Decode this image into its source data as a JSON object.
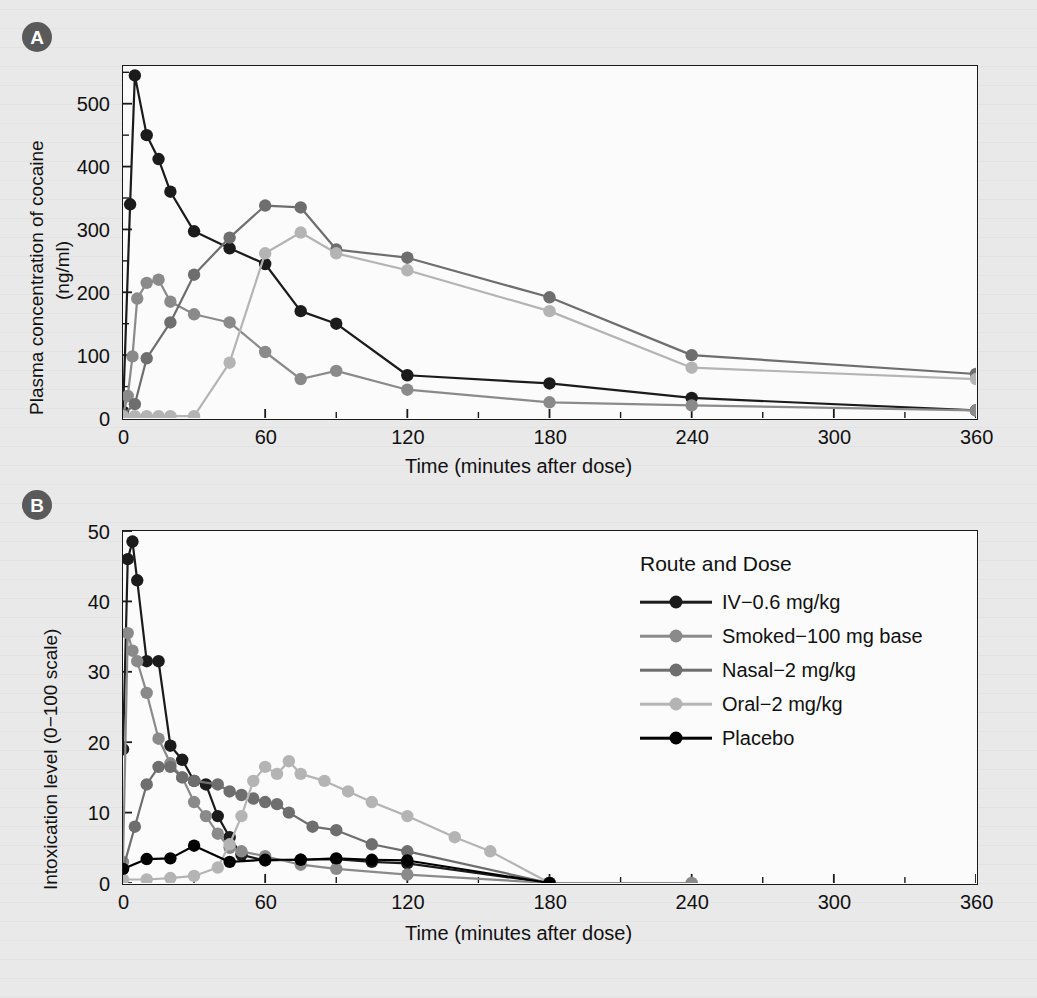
{
  "figure": {
    "panel_a_label": "A",
    "panel_b_label": "B"
  },
  "legend": {
    "title": "Route and Dose",
    "entries": [
      {
        "label": "IV−0.6 mg/kg",
        "color": "#1b1b1b",
        "key": "iv"
      },
      {
        "label": "Smoked−100 mg base",
        "color": "#8a8a8a",
        "key": "smoked"
      },
      {
        "label": "Nasal−2 mg/kg",
        "color": "#6e6e6e",
        "key": "nasal"
      },
      {
        "label": "Oral−2 mg/kg",
        "color": "#b4b4b4",
        "key": "oral"
      },
      {
        "label": "Placebo",
        "color": "#000000",
        "key": "placebo"
      }
    ]
  },
  "chart_data": [
    {
      "id": "panel-a",
      "type": "line",
      "title": "",
      "xlabel": "Time (minutes after dose)",
      "ylabel": "Plasma concentration of cocaine (ng/ml)",
      "ylabel_line1": "Plasma concentration of cocaine",
      "ylabel_line2": "(ng/ml)",
      "xlim": [
        0,
        360
      ],
      "ylim": [
        0,
        560
      ],
      "xticks": [
        0,
        60,
        120,
        180,
        240,
        300,
        360
      ],
      "xtick_labels": [
        "0",
        "60",
        "120",
        "180",
        "240",
        "300",
        "360"
      ],
      "xminor_step": 30,
      "yticks": [
        0,
        100,
        200,
        300,
        400,
        500
      ],
      "ytick_labels": [
        "0",
        "100",
        "200",
        "300",
        "400",
        "500"
      ],
      "yminor_step": 50,
      "grid": false,
      "legend_position": "none",
      "series": [
        {
          "name": "IV−0.6 mg/kg",
          "color": "#1b1b1b",
          "x": [
            0,
            3,
            5,
            10,
            15,
            20,
            30,
            45,
            60,
            75,
            90,
            120,
            180,
            240,
            360
          ],
          "y": [
            10,
            340,
            545,
            450,
            412,
            360,
            297,
            270,
            245,
            170,
            150,
            68,
            55,
            32,
            12
          ]
        },
        {
          "name": "Smoked−100 mg base",
          "color": "#8a8a8a",
          "x": [
            0,
            2,
            4,
            6,
            10,
            15,
            20,
            30,
            45,
            60,
            75,
            90,
            120,
            180,
            240,
            360
          ],
          "y": [
            5,
            35,
            98,
            190,
            215,
            220,
            185,
            165,
            152,
            105,
            62,
            75,
            45,
            25,
            20,
            12
          ]
        },
        {
          "name": "Nasal−2 mg/kg",
          "color": "#6e6e6e",
          "x": [
            0,
            5,
            10,
            20,
            30,
            45,
            60,
            75,
            90,
            120,
            180,
            240,
            360
          ],
          "y": [
            5,
            22,
            95,
            152,
            228,
            287,
            338,
            335,
            268,
            255,
            192,
            100,
            70,
            30
          ]
        },
        {
          "name": "Oral−2 mg/kg",
          "color": "#b4b4b4",
          "x": [
            0,
            5,
            10,
            15,
            20,
            30,
            45,
            60,
            75,
            90,
            120,
            180,
            240,
            360
          ],
          "y": [
            3,
            3,
            3,
            3,
            3,
            3,
            88,
            262,
            295,
            262,
            235,
            170,
            80,
            62,
            28
          ]
        }
      ],
      "series_notes": "Panel A shows plasma cocaine concentration vs time for four routes of administration."
    },
    {
      "id": "panel-b",
      "type": "line",
      "title": "",
      "xlabel": "Time (minutes after dose)",
      "ylabel": "Intoxication level (0−100 scale)",
      "xlim": [
        0,
        360
      ],
      "ylim": [
        0,
        50
      ],
      "xticks": [
        0,
        60,
        120,
        180,
        240,
        300,
        360
      ],
      "xtick_labels": [
        "0",
        "60",
        "120",
        "180",
        "240",
        "300",
        "360"
      ],
      "xminor_step": 30,
      "yticks": [
        0,
        10,
        20,
        30,
        40,
        50
      ],
      "ytick_labels": [
        "0",
        "10",
        "20",
        "30",
        "40",
        "50"
      ],
      "yminor_step": 10,
      "grid": false,
      "legend_position": "upper right",
      "series": [
        {
          "name": "IV−0.6 mg/kg",
          "color": "#1b1b1b",
          "x": [
            0,
            2,
            4,
            6,
            10,
            15,
            20,
            25,
            30,
            35,
            40,
            45,
            50,
            60,
            75,
            90,
            105,
            120,
            180
          ],
          "y": [
            19,
            46,
            48.5,
            43,
            31.5,
            31.5,
            19.5,
            17.5,
            14.5,
            14,
            9.5,
            6.5,
            4.0,
            3.2,
            3.3,
            3.4,
            3.0,
            2.8,
            0
          ]
        },
        {
          "name": "Smoked−100 mg base",
          "color": "#8a8a8a",
          "x": [
            0,
            2,
            4,
            6,
            10,
            15,
            20,
            25,
            30,
            35,
            40,
            45,
            50,
            60,
            75,
            90,
            120,
            180,
            240
          ],
          "y": [
            3,
            35.5,
            33,
            31.5,
            27,
            20.5,
            17,
            15,
            11.5,
            9.5,
            7,
            5,
            4.5,
            3.8,
            2.6,
            2.0,
            1.2,
            0,
            0
          ]
        },
        {
          "name": "Nasal−2 mg/kg",
          "color": "#6e6e6e",
          "x": [
            0,
            5,
            10,
            15,
            20,
            25,
            30,
            40,
            45,
            50,
            55,
            60,
            65,
            70,
            80,
            90,
            105,
            120,
            180
          ],
          "y": [
            2,
            8,
            14,
            16.5,
            16.5,
            15,
            14.5,
            14,
            13,
            12.5,
            12,
            11.5,
            11.2,
            10,
            8,
            7.5,
            5.5,
            4.5,
            0
          ]
        },
        {
          "name": "Oral−2 mg/kg",
          "color": "#b4b4b4",
          "x": [
            0,
            10,
            20,
            30,
            40,
            45,
            50,
            55,
            60,
            65,
            70,
            75,
            85,
            95,
            105,
            120,
            140,
            155,
            180
          ],
          "y": [
            0.5,
            0.5,
            0.7,
            1.0,
            2.2,
            5.5,
            9.5,
            14.5,
            16.5,
            15.5,
            17.3,
            15.5,
            14.5,
            13.0,
            11.5,
            9.5,
            6.5,
            4.5,
            0
          ]
        },
        {
          "name": "Placebo",
          "color": "#000000",
          "x": [
            0,
            10,
            20,
            30,
            45,
            60,
            75,
            90,
            105,
            120,
            180
          ],
          "y": [
            2,
            3.4,
            3.5,
            5.3,
            3.0,
            3.3,
            3.3,
            3.5,
            3.3,
            3.2,
            0
          ]
        }
      ],
      "series_notes": "Panel B shows self-reported intoxication level vs time for four routes plus placebo."
    }
  ]
}
